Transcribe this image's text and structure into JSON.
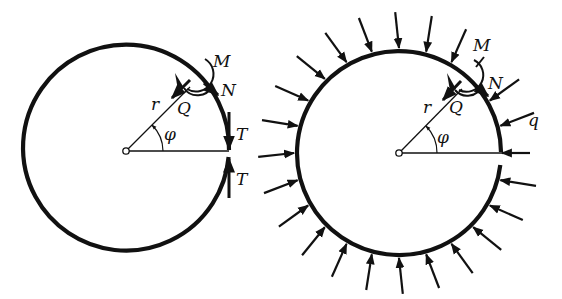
{
  "figure": {
    "colors": {
      "ink": "#111111",
      "background": "#ffffff"
    },
    "left_ring": {
      "description": "Cut ring with end forces T and internal forces M, N, Q at angle phi",
      "center": [
        126,
        151
      ],
      "radius": 103,
      "labels": {
        "moment": "M",
        "normal": "N",
        "shear": "Q",
        "radius": "r",
        "angle": "φ",
        "end_force_top": "T",
        "end_force_bottom": "T"
      }
    },
    "right_ring": {
      "description": "Cut ring under uniform external pressure q with internal forces M, N, Q at angle phi",
      "center": [
        399,
        153
      ],
      "radius": 102,
      "pressure_arrow_spacing_deg": 15,
      "labels": {
        "moment": "M",
        "normal": "N",
        "shear": "Q",
        "radius": "r",
        "angle": "φ",
        "pressure": "q"
      }
    }
  }
}
